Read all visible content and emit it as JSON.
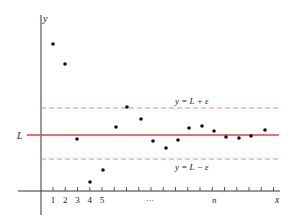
{
  "figure": {
    "title": "",
    "y_axis_label": "y",
    "x_axis_label": "x",
    "limit_label": "L",
    "upper_band_label": "y = L + ε",
    "lower_band_label": "y = L − ε",
    "tick_labels": [
      "1",
      "2",
      "3",
      "4",
      "5"
    ],
    "ellipsis_label": "···",
    "n_label": "n",
    "colors": {
      "limit_line": "#d9404a",
      "band_lines": "#e08890",
      "axes": "#333333",
      "points": "#111111"
    }
  },
  "chart_data": {
    "type": "scatter",
    "xlabel": "x",
    "ylabel": "y",
    "limit": "L",
    "band": [
      "L - ε",
      "L + ε"
    ],
    "x": [
      1,
      2,
      3,
      4,
      5,
      6,
      7,
      8,
      9,
      10,
      11,
      12,
      13,
      14,
      15,
      16,
      17,
      18
    ],
    "px": [
      [
        53,
        44
      ],
      [
        65,
        64
      ],
      [
        77,
        139
      ],
      [
        90,
        182
      ],
      [
        103,
        170
      ],
      [
        116,
        127
      ],
      [
        127,
        107
      ],
      [
        141,
        119
      ],
      [
        153,
        141
      ],
      [
        166,
        148
      ],
      [
        178,
        140
      ],
      [
        189,
        128
      ],
      [
        202,
        126
      ],
      [
        214,
        131
      ],
      [
        226,
        137
      ],
      [
        239,
        138
      ],
      [
        251,
        136
      ],
      [
        265,
        130
      ]
    ]
  }
}
